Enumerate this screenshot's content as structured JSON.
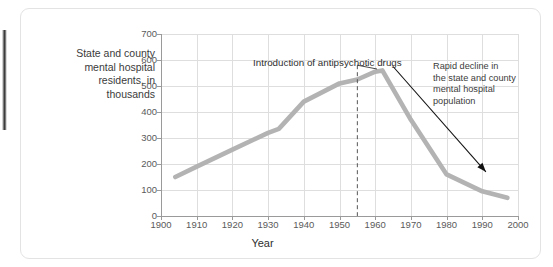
{
  "figure": {
    "y_axis_caption_lines": [
      "State and county",
      "mental hospital",
      "residents, in",
      "thousands"
    ],
    "x_axis_title": "Year",
    "annotations": {
      "intro": "Introduction of antipsychotic drugs",
      "decline_lines": [
        "Rapid decline in",
        "the state and county",
        "mental hospital",
        "population"
      ]
    },
    "colors": {
      "series_line": "#b3b3b3",
      "gridline": "#dedede",
      "axis": "#9a9a9a",
      "annotation_text": "#2e2e2e",
      "tick_text": "#5a5a5a",
      "card_border": "#e3e3e3",
      "background": "#ffffff",
      "arrow": "#111111"
    }
  },
  "chart_data": {
    "type": "line",
    "title": "",
    "subtitle": "",
    "xlabel": "Year",
    "ylabel": "State and county mental hospital residents, in thousands",
    "xlim": [
      1900,
      2000
    ],
    "ylim": [
      0,
      700
    ],
    "xticks": [
      1900,
      1910,
      1920,
      1930,
      1940,
      1950,
      1960,
      1970,
      1980,
      1990,
      2000
    ],
    "yticks": [
      0,
      100,
      200,
      300,
      400,
      500,
      600,
      700
    ],
    "xtick_labels": [
      "1900",
      "1910",
      "1920",
      "1930",
      "1940",
      "1950",
      "1960",
      "1970",
      "1980",
      "1990",
      "2000"
    ],
    "ytick_labels": [
      "0",
      "100",
      "200",
      "300",
      "400",
      "500",
      "600",
      "700"
    ],
    "grid": true,
    "legend": false,
    "legend_position": "none",
    "series": [
      {
        "name": "State and county mental hospital residents (thousands)",
        "color": "#b3b3b3",
        "x": [
          1904,
          1910,
          1920,
          1930,
          1933,
          1940,
          1950,
          1955,
          1960,
          1962,
          1970,
          1980,
          1990,
          1997
        ],
        "values": [
          150,
          190,
          255,
          320,
          335,
          440,
          510,
          525,
          555,
          560,
          370,
          160,
          95,
          70
        ]
      }
    ],
    "annotations": [
      {
        "type": "vline-with-label",
        "label": "Introduction of antipsychotic drugs",
        "x": 1955,
        "style": "dashed",
        "label_x": 1955,
        "label_y": 690
      },
      {
        "type": "arrow-with-label",
        "label": "Rapid decline in the state and county mental hospital population",
        "arrow_from": [
          1965,
          575
        ],
        "arrow_to": [
          1991,
          170
        ]
      }
    ]
  }
}
